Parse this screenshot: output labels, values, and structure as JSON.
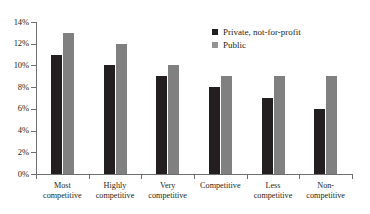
{
  "chart_data": {
    "type": "bar",
    "title": "",
    "xlabel": "",
    "ylabel": "",
    "ylim": [
      0,
      14
    ],
    "grid": false,
    "legend_position": "top-right",
    "categories": [
      "Most competitive",
      "Highly competitive",
      "Very competitive",
      "Competitive",
      "Less competitive",
      "Non-competitive"
    ],
    "category_lines": [
      [
        "Most",
        "competitive"
      ],
      [
        "Highly",
        "competitive"
      ],
      [
        "Very",
        "competitive"
      ],
      [
        "Competitive",
        ""
      ],
      [
        "Less",
        "competitive"
      ],
      [
        "Non-",
        "competitive"
      ]
    ],
    "ytick_labels": [
      "0%",
      "2%",
      "4%",
      "6%",
      "8%",
      "10%",
      "12%",
      "14%"
    ],
    "ytick_values": [
      0,
      2,
      4,
      6,
      8,
      10,
      12,
      14
    ],
    "series": [
      {
        "name": "Private, not-for-profit",
        "color": "#231f20",
        "values": [
          11,
          10,
          9,
          8,
          7,
          6
        ]
      },
      {
        "name": "Public",
        "color": "#808080",
        "values": [
          13,
          12,
          10,
          9,
          9,
          9
        ]
      }
    ]
  },
  "legend": {
    "items": [
      {
        "label": "Private, not-for-profit",
        "swatch": "#231f20"
      },
      {
        "label": "Public",
        "swatch": "#949494"
      }
    ]
  },
  "axes": {
    "y_max_label": "14%",
    "x_axis_name": "competitiveness-category",
    "y_axis_name": "percentage"
  }
}
